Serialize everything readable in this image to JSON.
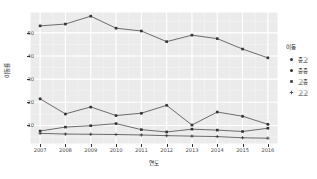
{
  "chart_data": {
    "type": "line",
    "title": "",
    "xlabel": "연도",
    "ylabel": "이동률",
    "x": [
      2007,
      2008,
      2009,
      2010,
      2011,
      2012,
      2013,
      2014,
      2015,
      2016
    ],
    "xticklabels": [
      "2007",
      "2008",
      "2009",
      "2010",
      "2011",
      "2012",
      "2013",
      "2014",
      "2015",
      "2016"
    ],
    "yticklabels": [
      "50",
      "40",
      "30",
      "20",
      "10"
    ],
    "yticks": [
      50,
      40,
      30,
      20,
      10
    ],
    "ylim": [
      2,
      59
    ],
    "xlim": [
      2006.6,
      2016.4
    ],
    "grid": true,
    "legend_position": "right",
    "legend_title": "이동",
    "series": [
      {
        "name": "고고",
        "marker": "square",
        "color": "#333333",
        "values": [
          53.0,
          53.8,
          57.2,
          52.0,
          50.8,
          46.2,
          49.0,
          47.5,
          43.0,
          39.2
        ]
      },
      {
        "name": "중고",
        "marker": "circle",
        "color": "#333333",
        "values": [
          21.5,
          15.0,
          18.0,
          14.3,
          15.3,
          18.7,
          10.2,
          15.8,
          14.0,
          10.5
        ]
      },
      {
        "name": "고중",
        "marker": "square-filled",
        "color": "#333333",
        "values": [
          7.6,
          9.3,
          9.9,
          10.8,
          8.2,
          7.2,
          8.4,
          8.0,
          7.4,
          8.8
        ]
      },
      {
        "name": "중중",
        "marker": "plus",
        "color": "#333333",
        "values": [
          6.6,
          6.3,
          6.2,
          6.1,
          5.9,
          5.6,
          5.4,
          5.2,
          4.7,
          4.5
        ]
      }
    ]
  },
  "axes": {
    "y_title": "이동률",
    "x_title": "연도"
  },
  "legend": {
    "title": "이동",
    "items": [
      {
        "label": "중고",
        "marker": "circle-small"
      },
      {
        "label": "중중",
        "marker": "circle-small"
      },
      {
        "label": "고중",
        "marker": "square-small"
      },
      {
        "label": "고고",
        "marker": "plus-small"
      }
    ]
  },
  "colors": {
    "panel_background": "#ebebeb",
    "grid_major": "#ffffff",
    "grid_minor": "#f5f5f5",
    "line": "#333333",
    "tick_text": "#4d4d4d",
    "title_text": "#1a1a1a"
  }
}
